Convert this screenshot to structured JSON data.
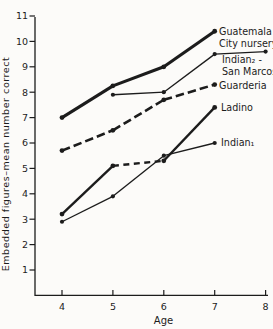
{
  "figure": {
    "ink": "#1c1c1c",
    "background": "#fcfbf9"
  },
  "chart_data": {
    "type": "line",
    "title": "",
    "xlabel": "Age",
    "ylabel": "Embedded figures–mean number correct",
    "x_ticks": [
      4,
      5,
      6,
      7,
      8
    ],
    "y_ticks": [
      1,
      2,
      3,
      4,
      5,
      6,
      7,
      8,
      9,
      10,
      11
    ],
    "xlim": [
      3.45,
      8.15
    ],
    "ylim": [
      0,
      11
    ],
    "grid": false,
    "legend_position": "inline-right-of-lines",
    "series": [
      {
        "id": "guatemala-city-nursery",
        "name": "Guatemala City nursery",
        "label_lines": [
          "Guatemala",
          "City nursery"
        ],
        "label_pos": {
          "x": 219,
          "y": 35
        },
        "points": [
          [
            4,
            7.0
          ],
          [
            5,
            8.25
          ],
          [
            6,
            9.0
          ],
          [
            7,
            10.4
          ]
        ],
        "weight": "heavy",
        "dash": "solid"
      },
      {
        "id": "indian2-san-marcos",
        "name": "Indian₂ - San Marcos",
        "label_lines": [
          "Indian₂ -",
          "San Marcos"
        ],
        "label_pos": {
          "x": 222,
          "y": 63
        },
        "points": [
          [
            5,
            7.9
          ],
          [
            6,
            8.0
          ],
          [
            7,
            9.5
          ],
          [
            8,
            9.6
          ]
        ],
        "weight": "thin",
        "dash": "solid"
      },
      {
        "id": "guarderia",
        "name": "Guarderia",
        "label_lines": [
          "Guarderia"
        ],
        "label_pos": {
          "x": 219,
          "y": 89
        },
        "points": [
          [
            4,
            5.7
          ],
          [
            5,
            6.5
          ],
          [
            6,
            7.7
          ],
          [
            7,
            8.3
          ]
        ],
        "weight": "thick",
        "dash": "dashed",
        "dash_pattern": "8.5 4"
      },
      {
        "id": "ladino",
        "name": "Ladino",
        "label_lines": [
          "Ladino"
        ],
        "label_pos": {
          "x": 221,
          "y": 111
        },
        "points": [
          [
            4,
            3.2
          ],
          [
            5,
            5.1
          ],
          [
            6,
            5.3
          ],
          [
            7,
            7.4
          ]
        ],
        "weight": "medium",
        "dash": "solid",
        "dashed_segments": [
          1
        ],
        "dash_pattern": "6 4.5"
      },
      {
        "id": "indian1",
        "name": "Indian₁",
        "label_lines": [
          "Indian₁"
        ],
        "label_pos": {
          "x": 221,
          "y": 146
        },
        "points": [
          [
            4,
            2.9
          ],
          [
            5,
            3.9
          ],
          [
            6,
            5.5
          ],
          [
            7,
            6.0
          ]
        ],
        "weight": "thin",
        "dash": "solid"
      }
    ]
  }
}
